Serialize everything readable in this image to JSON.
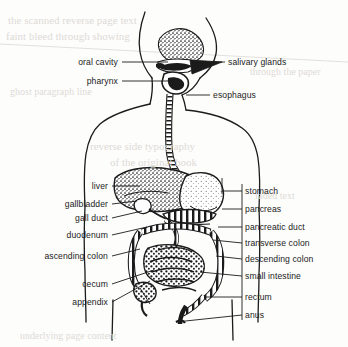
{
  "figure": {
    "background_color": "#fdfdfc",
    "ink_color": "#1b1b1b",
    "ghost_color": "#dedbd6",
    "labels_left": [
      {
        "id": "oral-cavity",
        "text": "oral cavity",
        "x": 118,
        "y": 62,
        "leader": [
          [
            122,
            62
          ],
          [
            168,
            62
          ]
        ]
      },
      {
        "id": "pharynx",
        "text": "pharynx",
        "x": 118,
        "y": 81,
        "leader": [
          [
            122,
            81
          ],
          [
            172,
            81
          ]
        ]
      },
      {
        "id": "liver",
        "text": "liver",
        "x": 108,
        "y": 186,
        "leader": [
          [
            112,
            186
          ],
          [
            140,
            186
          ]
        ]
      },
      {
        "id": "gallbladder",
        "text": "gallbladder",
        "x": 108,
        "y": 204,
        "leader": [
          [
            112,
            204
          ],
          [
            137,
            201
          ]
        ]
      },
      {
        "id": "gall-duct",
        "text": "gall duct",
        "x": 108,
        "y": 218,
        "leader": [
          [
            112,
            218
          ],
          [
            140,
            212
          ]
        ]
      },
      {
        "id": "duodenum",
        "text": "duodenum",
        "x": 108,
        "y": 235,
        "leader": [
          [
            112,
            235
          ],
          [
            145,
            228
          ]
        ]
      },
      {
        "id": "ascending-colon",
        "text": "ascending colon",
        "x": 108,
        "y": 256,
        "leader": [
          [
            112,
            256
          ],
          [
            140,
            250
          ]
        ]
      },
      {
        "id": "cecum",
        "text": "cecum",
        "x": 108,
        "y": 284,
        "leader": [
          [
            112,
            284
          ],
          [
            152,
            272
          ]
        ]
      },
      {
        "id": "appendix",
        "text": "appendix",
        "x": 108,
        "y": 302,
        "leader": [
          [
            112,
            302
          ],
          [
            150,
            282
          ]
        ]
      }
    ],
    "labels_right": [
      {
        "id": "salivary-glands",
        "text": "salivary glands",
        "x": 228,
        "y": 62,
        "leader": [
          [
            196,
            62
          ],
          [
            225,
            62
          ]
        ]
      },
      {
        "id": "esophagus",
        "text": "esophagus",
        "x": 213,
        "y": 95,
        "leader": [
          [
            186,
            95
          ],
          [
            210,
            95
          ]
        ]
      },
      {
        "id": "stomach",
        "text": "stomach",
        "x": 245,
        "y": 191,
        "leader": [
          [
            222,
            191
          ],
          [
            242,
            191
          ]
        ]
      },
      {
        "id": "pancreas",
        "text": "pancreas",
        "x": 245,
        "y": 209,
        "leader": [
          [
            222,
            209
          ],
          [
            242,
            209
          ]
        ]
      },
      {
        "id": "pancreatic-duct",
        "text": "pancreatic duct",
        "x": 245,
        "y": 227,
        "leader": [
          [
            219,
            227
          ],
          [
            242,
            227
          ]
        ]
      },
      {
        "id": "transverse-colon",
        "text": "transverse colon",
        "x": 245,
        "y": 243,
        "leader": [
          [
            214,
            243
          ],
          [
            242,
            243
          ]
        ]
      },
      {
        "id": "descending-colon",
        "text": "descending colon",
        "x": 245,
        "y": 259,
        "leader": [
          [
            216,
            259
          ],
          [
            242,
            259
          ]
        ]
      },
      {
        "id": "small-intestine",
        "text": "small intestine",
        "x": 245,
        "y": 276,
        "leader": [
          [
            212,
            276
          ],
          [
            242,
            276
          ]
        ]
      },
      {
        "id": "rectum",
        "text": "rectum",
        "x": 245,
        "y": 297,
        "leader": [
          [
            206,
            297
          ],
          [
            242,
            297
          ]
        ]
      },
      {
        "id": "anus",
        "text": "anus",
        "x": 245,
        "y": 315,
        "leader": [
          [
            172,
            315
          ],
          [
            242,
            315
          ]
        ]
      }
    ],
    "ghost_lines": [
      {
        "text": "the scanned reverse page text",
        "x": 8,
        "y": 14,
        "size": 11
      },
      {
        "text": "faint bleed through showing",
        "x": 6,
        "y": 30,
        "size": 11
      },
      {
        "text": "through the paper",
        "x": 250,
        "y": 66,
        "size": 10
      },
      {
        "text": "ghost paragraph line",
        "x": 10,
        "y": 86,
        "size": 10
      },
      {
        "text": "reverse side typography",
        "x": 90,
        "y": 140,
        "size": 11
      },
      {
        "text": "of the original book",
        "x": 110,
        "y": 156,
        "size": 11
      },
      {
        "text": "faded text",
        "x": 255,
        "y": 190,
        "size": 10
      },
      {
        "text": "underlying page content",
        "x": 20,
        "y": 330,
        "size": 10
      }
    ]
  }
}
